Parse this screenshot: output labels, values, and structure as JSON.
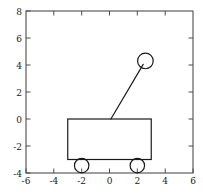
{
  "chart_data": {
    "type": "diagram",
    "title": "",
    "xlabel": "",
    "ylabel": "",
    "xlim": [
      -6,
      6
    ],
    "ylim": [
      -4,
      8
    ],
    "xticks": [
      -6,
      -4,
      -2,
      0,
      2,
      4,
      6
    ],
    "yticks": [
      -4,
      -2,
      0,
      2,
      4,
      6,
      8
    ],
    "xtick_labels": [
      "-6",
      "-4",
      "-2",
      "0",
      "2",
      "4",
      "6"
    ],
    "ytick_labels": [
      "-4",
      "-2",
      "0",
      "2",
      "4",
      "6",
      "8"
    ],
    "grid": false,
    "legend": false,
    "aspect": "equal",
    "background_color": "#ffffff",
    "line_color": "#1a1a1a",
    "axis_color": "#4d4d4d",
    "objects": [
      {
        "name": "cart-body",
        "shape": "rectangle",
        "x_min": -3.0,
        "x_max": 3.0,
        "y_min": -3.0,
        "y_max": 0.0,
        "filled": false
      },
      {
        "name": "wheel-left",
        "shape": "circle",
        "cx": -2.0,
        "cy": -3.45,
        "r": 0.52,
        "filled": false
      },
      {
        "name": "wheel-right",
        "shape": "circle",
        "cx": 2.0,
        "cy": -3.45,
        "r": 0.52,
        "filled": false
      },
      {
        "name": "pendulum-rod",
        "shape": "line",
        "x1": 0.1,
        "y1": 0.0,
        "x2": 2.42,
        "y2": 4.05
      },
      {
        "name": "pendulum-bob",
        "shape": "circle",
        "cx": 2.58,
        "cy": 4.3,
        "r": 0.56,
        "filled": false
      }
    ]
  },
  "figure": {
    "label": "cart-pendulum-figure"
  }
}
